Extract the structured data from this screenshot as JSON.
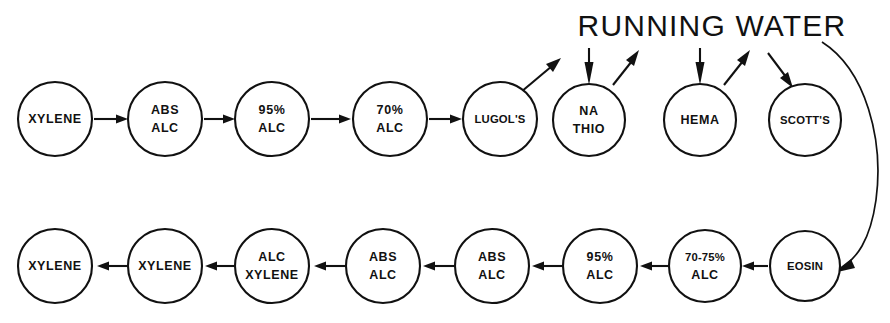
{
  "diagram": {
    "title_text": "RUNNING WATER",
    "ink_color": "#111111",
    "background_color": "#ffffff",
    "rows": [
      {
        "name": "top-row",
        "nodes": [
          {
            "id": "top-1",
            "lines": [
              "XYLENE"
            ],
            "cx": 55,
            "cy": 119,
            "r": 37
          },
          {
            "id": "top-2",
            "lines": [
              "ABS",
              "ALC"
            ],
            "cx": 165,
            "cy": 119,
            "r": 37
          },
          {
            "id": "top-3",
            "lines": [
              "95%",
              "ALC"
            ],
            "cx": 272,
            "cy": 119,
            "r": 37
          },
          {
            "id": "top-4",
            "lines": [
              "70%",
              "ALC"
            ],
            "cx": 390,
            "cy": 119,
            "r": 37
          },
          {
            "id": "top-5",
            "lines": [
              "LUGOL'S"
            ],
            "cx": 500,
            "cy": 119,
            "r": 37
          },
          {
            "id": "top-6",
            "lines": [
              "NA",
              "THIO"
            ],
            "cx": 589,
            "cy": 120,
            "r": 36
          },
          {
            "id": "top-7",
            "lines": [
              "HEMA"
            ],
            "cx": 700,
            "cy": 120,
            "r": 36
          },
          {
            "id": "top-8",
            "lines": [
              "SCOTT'S"
            ],
            "cx": 805,
            "cy": 120,
            "r": 36
          }
        ]
      },
      {
        "name": "bottom-row",
        "nodes": [
          {
            "id": "bot-1",
            "lines": [
              "XYLENE"
            ],
            "cx": 55,
            "cy": 266,
            "r": 37
          },
          {
            "id": "bot-2",
            "lines": [
              "XYLENE"
            ],
            "cx": 165,
            "cy": 266,
            "r": 37
          },
          {
            "id": "bot-3",
            "lines": [
              "ALC",
              "XYLENE"
            ],
            "cx": 272,
            "cy": 266,
            "r": 37
          },
          {
            "id": "bot-4",
            "lines": [
              "ABS",
              "ALC"
            ],
            "cx": 383,
            "cy": 266,
            "r": 37
          },
          {
            "id": "bot-5",
            "lines": [
              "ABS",
              "ALC"
            ],
            "cx": 492,
            "cy": 266,
            "r": 37
          },
          {
            "id": "bot-6",
            "lines": [
              "95%",
              "ALC"
            ],
            "cx": 600,
            "cy": 266,
            "r": 37
          },
          {
            "id": "bot-7",
            "lines": [
              "70-75%",
              "ALC"
            ],
            "cx": 705,
            "cy": 266,
            "r": 36
          },
          {
            "id": "bot-8",
            "lines": [
              "EOSIN"
            ],
            "cx": 805,
            "cy": 266,
            "r": 35
          }
        ]
      }
    ],
    "connectors": [
      {
        "id": "c-top-1-2",
        "kind": "straight-right",
        "from": "top-1",
        "to": "top-2"
      },
      {
        "id": "c-top-2-3",
        "kind": "straight-right",
        "from": "top-2",
        "to": "top-3"
      },
      {
        "id": "c-top-3-4",
        "kind": "straight-right",
        "from": "top-3",
        "to": "top-4"
      },
      {
        "id": "c-top-4-5",
        "kind": "straight-right",
        "from": "top-4",
        "to": "top-5"
      },
      {
        "id": "c-lugols-to-water",
        "kind": "diagonal-up-right",
        "from": "top-5",
        "to": "running-water"
      },
      {
        "id": "c-water-to-nathio",
        "kind": "vertical-down",
        "from": "running-water",
        "to": "top-6"
      },
      {
        "id": "c-nathio-to-water",
        "kind": "diagonal-up-right",
        "from": "top-6",
        "to": "running-water"
      },
      {
        "id": "c-water-to-hema",
        "kind": "vertical-down",
        "from": "running-water",
        "to": "top-7"
      },
      {
        "id": "c-hema-to-water",
        "kind": "diagonal-up-right",
        "from": "top-7",
        "to": "running-water"
      },
      {
        "id": "c-water-to-scotts",
        "kind": "diagonal-down-right",
        "from": "running-water",
        "to": "top-8"
      },
      {
        "id": "c-scotts-to-eosin",
        "kind": "curve-down",
        "from": "running-water",
        "to": "bot-8"
      },
      {
        "id": "c-bot-8-7",
        "kind": "straight-left",
        "from": "bot-8",
        "to": "bot-7"
      },
      {
        "id": "c-bot-7-6",
        "kind": "straight-left",
        "from": "bot-7",
        "to": "bot-6"
      },
      {
        "id": "c-bot-6-5",
        "kind": "straight-left",
        "from": "bot-6",
        "to": "bot-5"
      },
      {
        "id": "c-bot-5-4",
        "kind": "straight-left",
        "from": "bot-5",
        "to": "bot-4"
      },
      {
        "id": "c-bot-4-3",
        "kind": "straight-left",
        "from": "bot-4",
        "to": "bot-3"
      },
      {
        "id": "c-bot-3-2",
        "kind": "straight-left",
        "from": "bot-3",
        "to": "bot-2"
      },
      {
        "id": "c-bot-2-1",
        "kind": "straight-left",
        "from": "bot-2",
        "to": "bot-1"
      }
    ],
    "heading": {
      "text": "RUNNING WATER",
      "cx": 712,
      "cy": 27
    }
  }
}
